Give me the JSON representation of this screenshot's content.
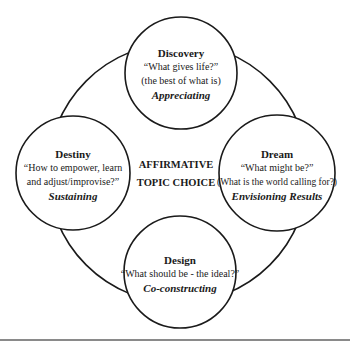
{
  "diagram": {
    "center": {
      "line1": "AFFIRMATIVE",
      "line2": "TOPIC CHOICE"
    },
    "nodes": {
      "discovery": {
        "title": "Discovery",
        "question1": "“What gives life?”",
        "question2": "(the best of what is)",
        "verb": "Appreciating"
      },
      "dream": {
        "title": "Dream",
        "question1": "“What might be?”",
        "question2": "(What is the world calling for?)",
        "verb": "Envisioning Results"
      },
      "design": {
        "title": "Design",
        "question1": "“What should be - the ideal?”",
        "verb": "Co-constructing"
      },
      "destiny": {
        "title": "Destiny",
        "question1": "“How to empower, learn",
        "question2": "and adjust/improvise?”",
        "verb": "Sustaining"
      }
    },
    "colors": {
      "stroke": "#1a1a1a",
      "rule": "#8a8a8a",
      "background": "#ffffff"
    }
  }
}
